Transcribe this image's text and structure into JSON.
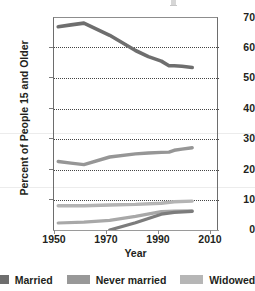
{
  "chart_data": {
    "type": "line",
    "title": "",
    "xlabel": "Year",
    "ylabel": "Percent of People 15 and Older",
    "xlim": [
      1948,
      2012
    ],
    "ylim": [
      0,
      70
    ],
    "yticks": [
      0,
      10,
      20,
      30,
      40,
      50,
      60,
      70
    ],
    "xticks": [
      1950,
      1970,
      1990,
      2010
    ],
    "grid": "horizontal-dotted",
    "legend_position": "bottom",
    "series": [
      {
        "name": "Married",
        "color": "#6e6e6e",
        "x": [
          1950,
          1955,
          1960,
          1970,
          1980,
          1985,
          1990,
          1993,
          1995,
          1998,
          2002
        ],
        "values": [
          66.8,
          67.4,
          68.0,
          64.0,
          59.0,
          57.0,
          55.5,
          54.0,
          54.0,
          53.8,
          53.4
        ]
      },
      {
        "name": "Never married",
        "color": "#969696",
        "x": [
          1950,
          1955,
          1960,
          1970,
          1980,
          1985,
          1990,
          1993,
          1995,
          1998,
          2002
        ],
        "values": [
          22.5,
          22.0,
          21.5,
          24.0,
          25.0,
          25.3,
          25.5,
          25.6,
          26.2,
          26.6,
          27.0
        ]
      },
      {
        "name": "Widowed",
        "color": "#b4b4b4",
        "x": [
          1950,
          1960,
          1970,
          1980,
          1990,
          1995,
          2002
        ],
        "values": [
          8.0,
          8.0,
          8.2,
          8.4,
          8.8,
          9.3,
          9.5
        ]
      },
      {
        "name": "Divorced",
        "color": "#a8a8a8",
        "x": [
          1950,
          1960,
          1970,
          1980,
          1990,
          1995,
          2002
        ],
        "values": [
          2.3,
          2.6,
          3.2,
          4.5,
          6.0,
          6.2,
          6.3
        ]
      },
      {
        "name": "Separated",
        "color": "#7c7c7c",
        "x": [
          1970,
          1980,
          1990,
          1995,
          2002
        ],
        "values": [
          0.0,
          2.4,
          5.2,
          5.8,
          6.1
        ]
      }
    ]
  },
  "legend": {
    "items": [
      {
        "label": "Married",
        "color": "#6e6e6e"
      },
      {
        "label": "Never married",
        "color": "#989898"
      },
      {
        "label": "Widowed",
        "color": "#b6b6b6"
      }
    ]
  },
  "axis": {
    "ytick_labels": [
      "70",
      "60",
      "50",
      "40",
      "30",
      "20",
      "10",
      "0"
    ],
    "xtick_labels": [
      "1950",
      "1970",
      "1990",
      "2010"
    ],
    "xaxis_title": "Year",
    "yaxis_title": "Percent of People 15 and Older"
  }
}
